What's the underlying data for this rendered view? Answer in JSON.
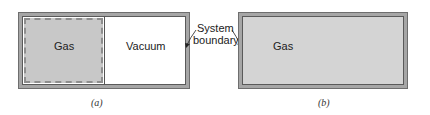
{
  "panel_a": {
    "gas_label": "Gas",
    "vacuum_label": "Vacuum",
    "caption": "(a)",
    "gas_fill": "#c8c8c8",
    "vacuum_fill": "#ffffff"
  },
  "panel_b": {
    "gas_label": "Gas",
    "caption": "(b)",
    "gas_fill": "#d4d4d4"
  },
  "annotation": {
    "line1": "System",
    "line2": "boundary"
  },
  "colors": {
    "wall": "#a6a6a6",
    "outline": "#5a5a5a"
  }
}
